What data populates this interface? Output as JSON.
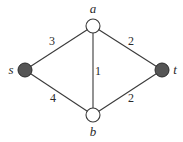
{
  "diagram": {
    "type": "weighted-graph",
    "nodes": [
      {
        "id": "s",
        "label": "s",
        "x": 25,
        "y": 70,
        "filled": true
      },
      {
        "id": "a",
        "label": "a",
        "x": 93,
        "y": 26,
        "filled": false
      },
      {
        "id": "b",
        "label": "b",
        "x": 93,
        "y": 115,
        "filled": false
      },
      {
        "id": "t",
        "label": "t",
        "x": 162,
        "y": 70,
        "filled": true
      }
    ],
    "edges": [
      {
        "from": "s",
        "to": "a",
        "weight": "3"
      },
      {
        "from": "a",
        "to": "t",
        "weight": "2"
      },
      {
        "from": "a",
        "to": "b",
        "weight": "1"
      },
      {
        "from": "s",
        "to": "b",
        "weight": "4"
      },
      {
        "from": "b",
        "to": "t",
        "weight": "2"
      }
    ],
    "colors": {
      "filled_node": "#555555",
      "open_node": "#ffffff",
      "stroke": "#3a3a3a"
    }
  }
}
